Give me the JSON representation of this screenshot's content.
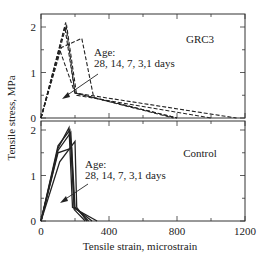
{
  "chart_data": [
    {
      "type": "line",
      "panel": "top",
      "label": "GRC3",
      "line_style": "dashed",
      "xlabel": "Tensile strain, microstrain",
      "ylabel": "Tensile stress, MPa",
      "xlim": [
        0,
        1200
      ],
      "ylim": [
        0,
        2.2
      ],
      "x_ticks": [
        0,
        400,
        800,
        1200
      ],
      "y_ticks": [
        0,
        1,
        2
      ],
      "annotation": "Age:\n28, 14, 7, 3,1 days",
      "annotation_lines": [
        "Age:",
        "28, 14, 7, 3,1 days"
      ],
      "series": [
        {
          "name": "28 days",
          "points": [
            [
              0,
              0
            ],
            [
              145,
              2.1
            ],
            [
              200,
              0.55
            ],
            [
              1150,
              0
            ]
          ]
        },
        {
          "name": "14 days",
          "points": [
            [
              0,
              0
            ],
            [
              150,
              2.05
            ],
            [
              210,
              0.5
            ],
            [
              1000,
              0
            ]
          ]
        },
        {
          "name": "7 days",
          "points": [
            [
              0,
              0
            ],
            [
              140,
              2.0
            ],
            [
              200,
              0.55
            ],
            [
              800,
              0
            ]
          ]
        },
        {
          "name": "3 days",
          "points": [
            [
              0,
              0
            ],
            [
              120,
              1.55
            ],
            [
              240,
              1.75
            ],
            [
              310,
              0.45
            ],
            [
              800,
              0
            ]
          ]
        },
        {
          "name": "1 day",
          "points": [
            [
              0,
              0
            ],
            [
              110,
              1.5
            ],
            [
              200,
              0.55
            ],
            [
              780,
              0
            ]
          ]
        }
      ]
    },
    {
      "type": "line",
      "panel": "bottom",
      "label": "Control",
      "line_style": "solid",
      "xlabel": "Tensile strain, microstrain",
      "ylabel": "Tensile stress, MPa",
      "xlim": [
        0,
        1200
      ],
      "ylim": [
        0,
        2.2
      ],
      "x_ticks": [
        0,
        400,
        800,
        1200
      ],
      "y_ticks": [
        0,
        1,
        2
      ],
      "annotation": "Age:\n28, 14, 7, 3,1 days",
      "annotation_lines": [
        "Age:",
        "28, 14, 7, 3,1 days"
      ],
      "series": [
        {
          "name": "28 days",
          "points": [
            [
              0,
              0
            ],
            [
              100,
              1.6
            ],
            [
              165,
              2.05
            ],
            [
              185,
              0.3
            ],
            [
              330,
              0
            ]
          ]
        },
        {
          "name": "14 days",
          "points": [
            [
              0,
              0
            ],
            [
              100,
              1.65
            ],
            [
              170,
              2.0
            ],
            [
              195,
              0.3
            ],
            [
              300,
              0
            ]
          ]
        },
        {
          "name": "7 days",
          "points": [
            [
              0,
              0
            ],
            [
              100,
              1.55
            ],
            [
              175,
              1.95
            ],
            [
              200,
              0.3
            ],
            [
              280,
              0
            ]
          ]
        },
        {
          "name": "3 days",
          "points": [
            [
              0,
              0
            ],
            [
              110,
              1.3
            ],
            [
              200,
              1.75
            ],
            [
              210,
              0.3
            ],
            [
              270,
              0
            ]
          ]
        },
        {
          "name": "1 day",
          "points": [
            [
              0,
              0
            ],
            [
              100,
              1.5
            ],
            [
              180,
              1.6
            ],
            [
              195,
              0.25
            ],
            [
              260,
              0
            ]
          ]
        }
      ]
    }
  ],
  "axes": {
    "xlabel": "Tensile strain, microstrain",
    "ylabel": "Tensile stress, MPa",
    "x_tick_labels": [
      "0",
      "400",
      "800",
      "1200"
    ],
    "y_tick_labels_top": [
      "0",
      "1",
      "2"
    ],
    "y_tick_labels_bottom": [
      "0",
      "1",
      "2"
    ]
  },
  "panels": {
    "top": {
      "label": "GRC3",
      "annotation_line1": "Age:",
      "annotation_line2": "28, 14, 7, 3,1 days"
    },
    "bottom": {
      "label": "Control",
      "annotation_line1": "Age:",
      "annotation_line2": "28, 14, 7, 3,1 days"
    }
  },
  "colors": {
    "line": "#222222",
    "axis": "#333333",
    "background": "#ffffff"
  }
}
